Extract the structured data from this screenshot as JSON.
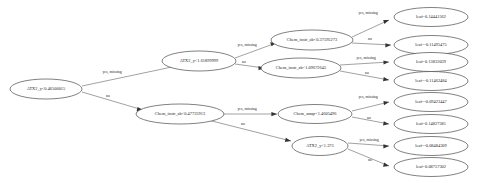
{
  "diagram": {
    "type": "decision-tree",
    "title": "",
    "background_color": "#ffffff",
    "node_fill": "#ffffff",
    "node_stroke": "#4a4a4a",
    "edge_color": "#555555",
    "text_color": "#1a1a1a"
  },
  "edge_labels": {
    "yes": "yes, missing",
    "no": "no"
  },
  "nodes": {
    "root": {
      "label": "ATX2_y<0.46500015",
      "kind": "split"
    },
    "n_top": {
      "label": "ATX2_y<1.61899999",
      "kind": "split"
    },
    "n_bottom": {
      "label": "Chem_instr_ab<0.47725913",
      "kind": "split"
    },
    "n_t1": {
      "label": "Chem_instr_ab<0.37595273",
      "kind": "split"
    },
    "n_t2": {
      "label": "Chem_instr_ab<1.09672645",
      "kind": "split"
    },
    "n_b1": {
      "label": "Chem_amqr<1.4605496",
      "kind": "split"
    },
    "n_b2": {
      "label": "ATX2_y<1.373",
      "kind": "split"
    }
  },
  "leaves": [
    {
      "id": "leaf1",
      "label": "leaf=0.14441562"
    },
    {
      "id": "leaf2",
      "label": "leaf=-0.11495475"
    },
    {
      "id": "leaf3",
      "label": "leaf=0.13832039"
    },
    {
      "id": "leaf4",
      "label": "leaf=-0.11462484"
    },
    {
      "id": "leaf5",
      "label": "leaf=-0.09423447"
    },
    {
      "id": "leaf6",
      "label": "leaf=0.14827381"
    },
    {
      "id": "leaf7",
      "label": "leaf=-0.08484309"
    },
    {
      "id": "leaf8",
      "label": "leaf=0.08757302"
    }
  ],
  "edges": [
    {
      "from": "root",
      "to": "n_top",
      "label": "yes, missing"
    },
    {
      "from": "root",
      "to": "n_bottom",
      "label": "no"
    },
    {
      "from": "n_top",
      "to": "n_t1",
      "label": "yes, missing"
    },
    {
      "from": "n_top",
      "to": "n_t2",
      "label": "no"
    },
    {
      "from": "n_t1",
      "to": "leaf1",
      "label": "yes, missing"
    },
    {
      "from": "n_t1",
      "to": "leaf2",
      "label": "no"
    },
    {
      "from": "n_t2",
      "to": "leaf3",
      "label": "yes, missing"
    },
    {
      "from": "n_t2",
      "to": "leaf4",
      "label": "no"
    },
    {
      "from": "n_bottom",
      "to": "n_b1",
      "label": "yes, missing"
    },
    {
      "from": "n_bottom",
      "to": "n_b2",
      "label": "no"
    },
    {
      "from": "n_b1",
      "to": "leaf5",
      "label": "yes, missing"
    },
    {
      "from": "n_b1",
      "to": "leaf6",
      "label": "no"
    },
    {
      "from": "n_b2",
      "to": "leaf7",
      "label": "yes, missing"
    },
    {
      "from": "n_b2",
      "to": "leaf8",
      "label": "no"
    }
  ]
}
